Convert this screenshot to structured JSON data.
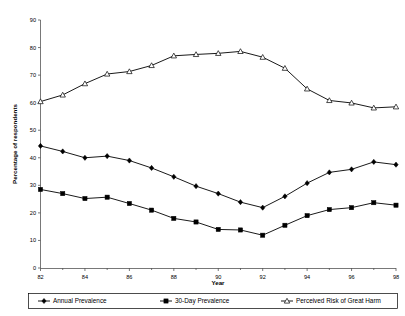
{
  "chart_data": {
    "type": "line",
    "title": "",
    "xlabel": "Year",
    "ylabel": "Percentage of respondents",
    "xlim": [
      82,
      98
    ],
    "ylim": [
      0,
      90
    ],
    "grid": false,
    "legend_position": "bottom",
    "x": [
      82,
      83,
      84,
      85,
      86,
      87,
      88,
      89,
      90,
      91,
      92,
      93,
      94,
      95,
      96,
      97,
      98
    ],
    "xticks_major": [
      82,
      84,
      86,
      88,
      90,
      92,
      94,
      96,
      98
    ],
    "xtick_labels": [
      "82",
      "84",
      "86",
      "88",
      "90",
      "92",
      "94",
      "96",
      "98"
    ],
    "yticks": [
      0,
      10,
      20,
      30,
      40,
      50,
      60,
      70,
      80,
      90
    ],
    "ytick_labels": [
      "0",
      "10",
      "20",
      "30",
      "40",
      "50",
      "60",
      "70",
      "80",
      "90"
    ],
    "series": [
      {
        "name": "Annual Prevalence",
        "marker": "diamond",
        "values": [
          44.3,
          42.3,
          40.0,
          40.6,
          39.0,
          36.3,
          33.1,
          29.7,
          27.0,
          23.9,
          21.9,
          26.0,
          30.8,
          34.7,
          35.8,
          38.5,
          37.5
        ]
      },
      {
        "name": "30-Day Prevalence",
        "marker": "square",
        "values": [
          28.5,
          27.0,
          25.2,
          25.7,
          23.4,
          21.0,
          18.0,
          16.7,
          14.0,
          13.8,
          11.9,
          15.5,
          19.0,
          21.2,
          21.9,
          23.7,
          22.8
        ]
      },
      {
        "name": "Perceived Risk of Great Harm",
        "marker": "triangle",
        "values": [
          60.4,
          62.8,
          66.9,
          70.4,
          71.3,
          73.5,
          77.0,
          77.5,
          77.9,
          78.6,
          76.5,
          72.5,
          65.0,
          60.8,
          59.9,
          58.1,
          58.5
        ]
      }
    ],
    "legend": [
      {
        "label": "Annual Prevalence",
        "marker": "diamond"
      },
      {
        "label": "30-Day Prevalence",
        "marker": "square"
      },
      {
        "label": "Perceived Risk of Great Harm",
        "marker": "triangle"
      }
    ]
  }
}
